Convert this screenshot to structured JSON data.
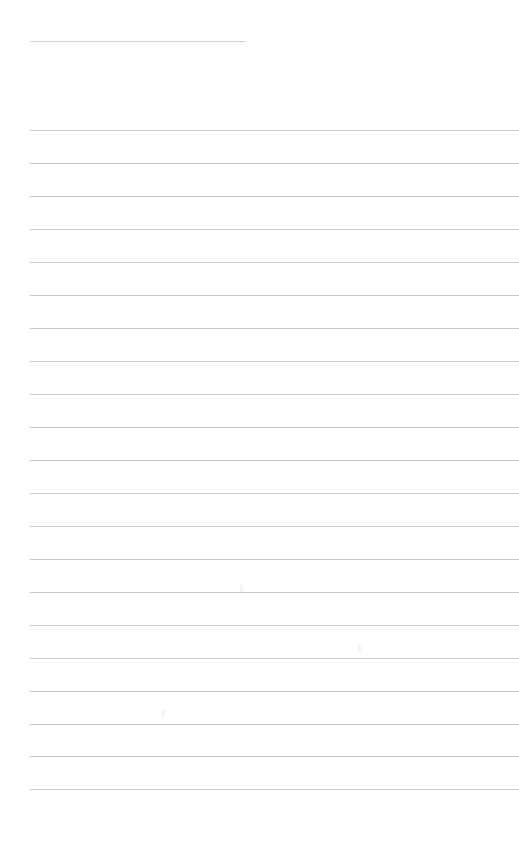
{
  "document": {
    "kind": "ruled-paper",
    "title": "",
    "body_text": "",
    "background_color": "#ffffff",
    "rule_color": "#c7c9cb",
    "page_width": 519,
    "page_height": 860
  },
  "layout": {
    "left_margin": 30,
    "right_edge": 519,
    "line_spacing": 33,
    "first_full_rule_y": 130,
    "last_full_rule_y": 789,
    "full_rule_count": 21
  },
  "header_rule": {
    "name": "title-rule",
    "x": 30,
    "y": 41,
    "width": 215,
    "color": "#cfd1d3",
    "label": ""
  },
  "rules": [
    {
      "index": 1,
      "y": 130,
      "x": 30,
      "width": 489,
      "text": ""
    },
    {
      "index": 2,
      "y": 163,
      "x": 30,
      "width": 489,
      "text": ""
    },
    {
      "index": 3,
      "y": 196,
      "x": 30,
      "width": 489,
      "text": ""
    },
    {
      "index": 4,
      "y": 229,
      "x": 30,
      "width": 489,
      "text": ""
    },
    {
      "index": 5,
      "y": 262,
      "x": 30,
      "width": 489,
      "text": ""
    },
    {
      "index": 6,
      "y": 295,
      "x": 30,
      "width": 489,
      "text": ""
    },
    {
      "index": 7,
      "y": 328,
      "x": 30,
      "width": 489,
      "text": ""
    },
    {
      "index": 8,
      "y": 361,
      "x": 30,
      "width": 489,
      "text": ""
    },
    {
      "index": 9,
      "y": 394,
      "x": 30,
      "width": 489,
      "text": ""
    },
    {
      "index": 10,
      "y": 427,
      "x": 30,
      "width": 489,
      "text": ""
    },
    {
      "index": 11,
      "y": 460,
      "x": 30,
      "width": 489,
      "text": ""
    },
    {
      "index": 12,
      "y": 493,
      "x": 30,
      "width": 489,
      "text": ""
    },
    {
      "index": 13,
      "y": 526,
      "x": 30,
      "width": 489,
      "text": ""
    },
    {
      "index": 14,
      "y": 559,
      "x": 30,
      "width": 489,
      "text": ""
    },
    {
      "index": 15,
      "y": 592,
      "x": 30,
      "width": 489,
      "text": ""
    },
    {
      "index": 16,
      "y": 625,
      "x": 30,
      "width": 489,
      "text": ""
    },
    {
      "index": 17,
      "y": 658,
      "x": 30,
      "width": 489,
      "text": ""
    },
    {
      "index": 18,
      "y": 691,
      "x": 30,
      "width": 489,
      "text": ""
    },
    {
      "index": 19,
      "y": 724,
      "x": 30,
      "width": 489,
      "text": ""
    },
    {
      "index": 20,
      "y": 756,
      "x": 30,
      "width": 489,
      "text": ""
    },
    {
      "index": 21,
      "y": 789,
      "x": 30,
      "width": 489,
      "text": ""
    }
  ],
  "artifacts": [
    {
      "x": 240,
      "y": 585
    },
    {
      "x": 358,
      "y": 645
    },
    {
      "x": 162,
      "y": 710
    }
  ]
}
